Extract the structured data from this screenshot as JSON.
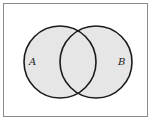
{
  "diagram": {
    "type": "venn",
    "sets": [
      {
        "name": "A",
        "label": "A",
        "cx": 60,
        "cy": 62,
        "r": 36
      },
      {
        "name": "B",
        "label": "B",
        "cx": 96,
        "cy": 62,
        "r": 36
      }
    ],
    "colors": {
      "fill": "#e6e6e6",
      "stroke": "#1a1a1a",
      "frame": "#8a8a8a",
      "background": "#ffffff"
    }
  }
}
